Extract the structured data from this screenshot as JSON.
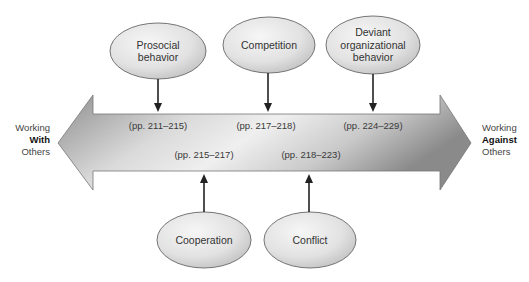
{
  "diagram": {
    "continuum": {
      "left_label": {
        "line1": "Working",
        "emphasis": "With",
        "line3": "Others"
      },
      "right_label": {
        "line1": "Working",
        "emphasis": "Against",
        "line3": "Others"
      }
    },
    "top_nodes": [
      {
        "label_lines": [
          "Prosocial",
          "behavior"
        ],
        "pages": "(pp. 211–215)"
      },
      {
        "label_lines": [
          "Competition"
        ],
        "pages": "(pp. 217–218)"
      },
      {
        "label_lines": [
          "Deviant",
          "organizational",
          "behavior"
        ],
        "pages": "(pp. 224–229)"
      }
    ],
    "bottom_nodes": [
      {
        "label_lines": [
          "Cooperation"
        ],
        "pages": "(pp. 215–217)"
      },
      {
        "label_lines": [
          "Conflict"
        ],
        "pages": "(pp. 218–223)"
      }
    ],
    "colors": {
      "arrow_light": "#f2f2f2",
      "arrow_dark": "#8c8c8c",
      "ellipse_light": "#f4f4f4",
      "ellipse_dark": "#c4c4c4",
      "stroke": "#555555",
      "connector": "#222222"
    }
  }
}
